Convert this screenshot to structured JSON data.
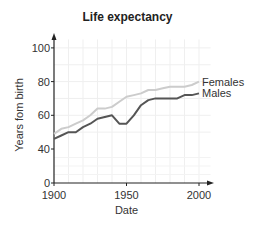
{
  "chart_data": {
    "type": "line",
    "title": "Life expectancy",
    "xlabel": "Date",
    "ylabel": "Years fom birth",
    "x_ticks": [
      1900,
      1950,
      2000
    ],
    "y_ticks": [
      0,
      40,
      60,
      80,
      100
    ],
    "xlim": [
      1900,
      2010
    ],
    "ylim": [
      0,
      105
    ],
    "y_axis_break": "between 0 and 40",
    "grid": true,
    "legend_position": "inline at line ends (right)",
    "x": [
      1900,
      1905,
      1910,
      1915,
      1920,
      1925,
      1930,
      1935,
      1940,
      1945,
      1950,
      1955,
      1960,
      1965,
      1970,
      1975,
      1980,
      1985,
      1990,
      1995,
      2000
    ],
    "series": [
      {
        "name": "Females",
        "color": "#cccccc",
        "values": [
          49,
          52,
          53,
          55,
          57,
          60,
          64,
          64,
          65,
          68,
          71,
          72,
          73,
          75,
          75,
          76,
          77,
          77,
          77,
          78,
          80
        ]
      },
      {
        "name": "Males",
        "color": "#555555",
        "values": [
          46,
          48,
          50,
          50,
          53,
          55,
          58,
          59,
          60,
          55,
          55,
          60,
          66,
          69,
          70,
          70,
          70,
          70,
          72,
          72,
          73
        ]
      }
    ]
  }
}
